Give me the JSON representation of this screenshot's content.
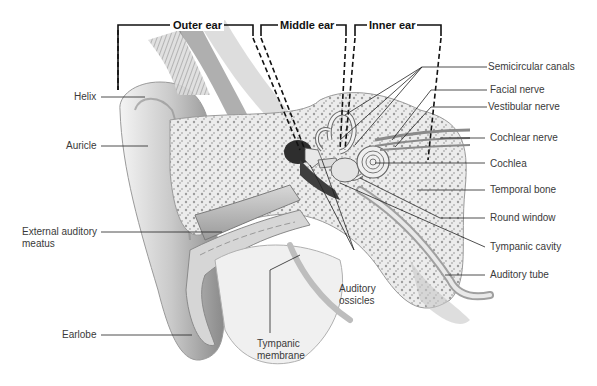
{
  "diagram": {
    "regions": [
      {
        "label": "Outer ear"
      },
      {
        "label": "Middle ear"
      },
      {
        "label": "Inner ear"
      }
    ],
    "labels_left": [
      {
        "label": "Helix"
      },
      {
        "label": "Auricle"
      },
      {
        "label": "External auditory meatus"
      },
      {
        "label": "Earlobe"
      }
    ],
    "labels_bottom": [
      {
        "label": "Tympanic membrane"
      },
      {
        "label": "Auditory ossicles"
      }
    ],
    "labels_right": [
      {
        "label": "Semicircular canals"
      },
      {
        "label": "Facial nerve"
      },
      {
        "label": "Vestibular nerve"
      },
      {
        "label": "Cochlear nerve"
      },
      {
        "label": "Cochlea"
      },
      {
        "label": "Temporal bone"
      },
      {
        "label": "Round window"
      },
      {
        "label": "Tympanic cavity"
      },
      {
        "label": "Auditory tube"
      }
    ],
    "colors": {
      "background": "#ffffff",
      "line": "#222222",
      "tissue_light": "#e6e6e6",
      "tissue_mid": "#b8b8b8",
      "tissue_dark": "#555555"
    }
  }
}
